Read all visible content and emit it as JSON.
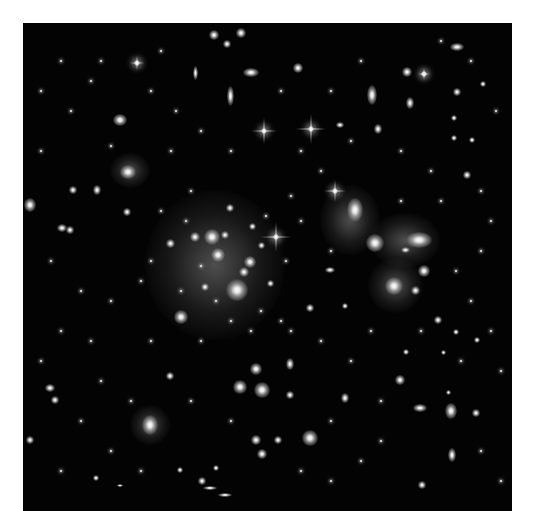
{
  "image": {
    "subject": "galaxy cluster deep field",
    "background_color": "#030303",
    "frame": {
      "x": 23,
      "y": 23,
      "width": 489,
      "height": 488
    }
  },
  "diffuse_glows": [
    {
      "x": 215,
      "y": 265,
      "w": 140,
      "h": 150
    },
    {
      "x": 350,
      "y": 220,
      "w": 60,
      "h": 70
    },
    {
      "x": 405,
      "y": 240,
      "w": 70,
      "h": 55
    },
    {
      "x": 395,
      "y": 285,
      "w": 55,
      "h": 55
    },
    {
      "x": 150,
      "y": 425,
      "w": 40,
      "h": 40
    },
    {
      "x": 130,
      "y": 170,
      "w": 40,
      "h": 35
    }
  ],
  "galaxies": [
    {
      "x": 237,
      "y": 290,
      "w": 22,
      "h": 22
    },
    {
      "x": 212,
      "y": 237,
      "w": 16,
      "h": 16
    },
    {
      "x": 218,
      "y": 255,
      "w": 14,
      "h": 14
    },
    {
      "x": 250,
      "y": 262,
      "w": 12,
      "h": 12
    },
    {
      "x": 244,
      "y": 272,
      "w": 10,
      "h": 10
    },
    {
      "x": 195,
      "y": 237,
      "w": 10,
      "h": 10
    },
    {
      "x": 225,
      "y": 235,
      "w": 8,
      "h": 8
    },
    {
      "x": 181,
      "y": 317,
      "w": 14,
      "h": 14
    },
    {
      "x": 170,
      "y": 243,
      "w": 9,
      "h": 9
    },
    {
      "x": 205,
      "y": 287,
      "w": 8,
      "h": 8
    },
    {
      "x": 230,
      "y": 208,
      "w": 8,
      "h": 8
    },
    {
      "x": 252,
      "y": 226,
      "w": 7,
      "h": 7
    },
    {
      "x": 261,
      "y": 245,
      "w": 7,
      "h": 7
    },
    {
      "x": 270,
      "y": 283,
      "w": 7,
      "h": 7
    },
    {
      "x": 310,
      "y": 308,
      "w": 8,
      "h": 8
    },
    {
      "x": 355,
      "y": 210,
      "w": 16,
      "h": 24
    },
    {
      "x": 375,
      "y": 243,
      "w": 18,
      "h": 18
    },
    {
      "x": 419,
      "y": 240,
      "w": 26,
      "h": 16
    },
    {
      "x": 394,
      "y": 286,
      "w": 18,
      "h": 18
    },
    {
      "x": 424,
      "y": 271,
      "w": 12,
      "h": 12
    },
    {
      "x": 415,
      "y": 290,
      "w": 9,
      "h": 9
    },
    {
      "x": 405,
      "y": 250,
      "w": 9,
      "h": 6
    },
    {
      "x": 262,
      "y": 390,
      "w": 16,
      "h": 16
    },
    {
      "x": 240,
      "y": 387,
      "w": 14,
      "h": 14
    },
    {
      "x": 256,
      "y": 369,
      "w": 12,
      "h": 12
    },
    {
      "x": 290,
      "y": 364,
      "w": 8,
      "h": 12
    },
    {
      "x": 310,
      "y": 438,
      "w": 16,
      "h": 16
    },
    {
      "x": 256,
      "y": 440,
      "w": 10,
      "h": 10
    },
    {
      "x": 262,
      "y": 454,
      "w": 10,
      "h": 10
    },
    {
      "x": 278,
      "y": 440,
      "w": 8,
      "h": 8
    },
    {
      "x": 150,
      "y": 425,
      "w": 16,
      "h": 20
    },
    {
      "x": 120,
      "y": 120,
      "w": 14,
      "h": 12
    },
    {
      "x": 128,
      "y": 172,
      "w": 16,
      "h": 14
    },
    {
      "x": 97,
      "y": 190,
      "w": 8,
      "h": 10
    },
    {
      "x": 73,
      "y": 190,
      "w": 8,
      "h": 8
    },
    {
      "x": 30,
      "y": 205,
      "w": 12,
      "h": 14
    },
    {
      "x": 70,
      "y": 230,
      "w": 8,
      "h": 8
    },
    {
      "x": 62,
      "y": 228,
      "w": 10,
      "h": 8
    },
    {
      "x": 127,
      "y": 212,
      "w": 8,
      "h": 8
    },
    {
      "x": 50,
      "y": 388,
      "w": 10,
      "h": 8
    },
    {
      "x": 55,
      "y": 400,
      "w": 8,
      "h": 8
    },
    {
      "x": 30,
      "y": 440,
      "w": 8,
      "h": 8
    },
    {
      "x": 214,
      "y": 35,
      "w": 10,
      "h": 10
    },
    {
      "x": 227,
      "y": 44,
      "w": 8,
      "h": 8
    },
    {
      "x": 241,
      "y": 33,
      "w": 10,
      "h": 10
    },
    {
      "x": 230,
      "y": 96,
      "w": 7,
      "h": 20
    },
    {
      "x": 251,
      "y": 72,
      "w": 16,
      "h": 9
    },
    {
      "x": 195,
      "y": 73,
      "w": 5,
      "h": 14
    },
    {
      "x": 298,
      "y": 68,
      "w": 10,
      "h": 10
    },
    {
      "x": 372,
      "y": 95,
      "w": 10,
      "h": 20
    },
    {
      "x": 407,
      "y": 72,
      "w": 10,
      "h": 10
    },
    {
      "x": 457,
      "y": 47,
      "w": 14,
      "h": 8
    },
    {
      "x": 457,
      "y": 92,
      "w": 8,
      "h": 8
    },
    {
      "x": 410,
      "y": 103,
      "w": 8,
      "h": 12
    },
    {
      "x": 378,
      "y": 129,
      "w": 8,
      "h": 10
    },
    {
      "x": 454,
      "y": 138,
      "w": 6,
      "h": 6
    },
    {
      "x": 454,
      "y": 118,
      "w": 6,
      "h": 6
    },
    {
      "x": 483,
      "y": 84,
      "w": 6,
      "h": 6
    },
    {
      "x": 472,
      "y": 140,
      "w": 6,
      "h": 6
    },
    {
      "x": 340,
      "y": 125,
      "w": 8,
      "h": 6
    },
    {
      "x": 467,
      "y": 175,
      "w": 8,
      "h": 8
    },
    {
      "x": 438,
      "y": 320,
      "w": 8,
      "h": 8
    },
    {
      "x": 443,
      "y": 352,
      "w": 5,
      "h": 5
    },
    {
      "x": 448,
      "y": 392,
      "w": 5,
      "h": 5
    },
    {
      "x": 400,
      "y": 380,
      "w": 10,
      "h": 10
    },
    {
      "x": 406,
      "y": 352,
      "w": 6,
      "h": 6
    },
    {
      "x": 451,
      "y": 411,
      "w": 12,
      "h": 16
    },
    {
      "x": 452,
      "y": 455,
      "w": 8,
      "h": 14
    },
    {
      "x": 422,
      "y": 485,
      "w": 8,
      "h": 8
    },
    {
      "x": 420,
      "y": 408,
      "w": 14,
      "h": 8
    },
    {
      "x": 476,
      "y": 413,
      "w": 8,
      "h": 8
    },
    {
      "x": 290,
      "y": 395,
      "w": 8,
      "h": 8
    },
    {
      "x": 345,
      "y": 398,
      "w": 8,
      "h": 10
    },
    {
      "x": 202,
      "y": 481,
      "w": 8,
      "h": 8
    },
    {
      "x": 216,
      "y": 468,
      "w": 6,
      "h": 6
    },
    {
      "x": 180,
      "y": 470,
      "w": 6,
      "h": 6
    },
    {
      "x": 96,
      "y": 478,
      "w": 6,
      "h": 6
    },
    {
      "x": 120,
      "y": 485,
      "w": 6,
      "h": 3
    },
    {
      "x": 170,
      "y": 376,
      "w": 8,
      "h": 8
    },
    {
      "x": 225,
      "y": 495,
      "w": 14,
      "h": 4
    },
    {
      "x": 210,
      "y": 488,
      "w": 14,
      "h": 4
    },
    {
      "x": 330,
      "y": 270,
      "w": 10,
      "h": 6
    },
    {
      "x": 345,
      "y": 306,
      "w": 6,
      "h": 6
    },
    {
      "x": 456,
      "y": 332,
      "w": 6,
      "h": 6
    },
    {
      "x": 477,
      "y": 340,
      "w": 6,
      "h": 6
    }
  ],
  "bright_stars": [
    {
      "x": 264,
      "y": 131,
      "len": 26
    },
    {
      "x": 311,
      "y": 129,
      "len": 30
    },
    {
      "x": 276,
      "y": 237,
      "len": 30
    },
    {
      "x": 335,
      "y": 191,
      "len": 22
    },
    {
      "x": 424,
      "y": 74,
      "len": 12
    },
    {
      "x": 137,
      "y": 63,
      "len": 14
    }
  ],
  "faint_stars": [
    [
      60,
      60
    ],
    [
      90,
      80
    ],
    [
      150,
      90
    ],
    [
      175,
      110
    ],
    [
      200,
      130
    ],
    [
      230,
      150
    ],
    [
      300,
      150
    ],
    [
      320,
      170
    ],
    [
      350,
      140
    ],
    [
      400,
      150
    ],
    [
      430,
      170
    ],
    [
      480,
      190
    ],
    [
      490,
      220
    ],
    [
      480,
      250
    ],
    [
      455,
      270
    ],
    [
      470,
      300
    ],
    [
      490,
      330
    ],
    [
      500,
      370
    ],
    [
      480,
      450
    ],
    [
      500,
      480
    ],
    [
      40,
      150
    ],
    [
      50,
      260
    ],
    [
      80,
      290
    ],
    [
      110,
      300
    ],
    [
      140,
      280
    ],
    [
      150,
      340
    ],
    [
      90,
      340
    ],
    [
      60,
      330
    ],
    [
      40,
      360
    ],
    [
      100,
      380
    ],
    [
      130,
      400
    ],
    [
      80,
      420
    ],
    [
      60,
      470
    ],
    [
      110,
      450
    ],
    [
      140,
      470
    ],
    [
      190,
      400
    ],
    [
      230,
      420
    ],
    [
      300,
      470
    ],
    [
      330,
      480
    ],
    [
      360,
      460
    ],
    [
      380,
      440
    ],
    [
      350,
      360
    ],
    [
      370,
      330
    ],
    [
      320,
      340
    ],
    [
      290,
      330
    ],
    [
      330,
      250
    ],
    [
      300,
      220
    ],
    [
      290,
      195
    ],
    [
      190,
      190
    ],
    [
      160,
      210
    ],
    [
      170,
      150
    ],
    [
      110,
      145
    ],
    [
      70,
      110
    ],
    [
      40,
      90
    ],
    [
      100,
      60
    ],
    [
      160,
      50
    ],
    [
      280,
      90
    ],
    [
      330,
      90
    ],
    [
      360,
      60
    ],
    [
      440,
      40
    ],
    [
      470,
      60
    ],
    [
      495,
      110
    ],
    [
      400,
      200
    ],
    [
      440,
      200
    ],
    [
      460,
      360
    ],
    [
      420,
      330
    ],
    [
      380,
      400
    ],
    [
      330,
      420
    ],
    [
      250,
      330
    ],
    [
      200,
      340
    ],
    [
      180,
      290
    ],
    [
      150,
      260
    ],
    [
      260,
      310
    ],
    [
      280,
      320
    ],
    [
      230,
      320
    ],
    [
      215,
      300
    ],
    [
      200,
      265
    ],
    [
      185,
      220
    ],
    [
      265,
      215
    ],
    [
      285,
      260
    ]
  ]
}
